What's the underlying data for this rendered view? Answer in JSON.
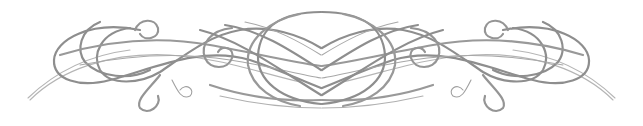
{
  "ornament": {
    "type": "calligraphic-flourish-divider",
    "stroke_color": "#8e8e8e",
    "light_stroke_color": "#b5b5b5",
    "background": "#ffffff",
    "symmetry": "horizontal-mirror",
    "center_x": 321
  }
}
